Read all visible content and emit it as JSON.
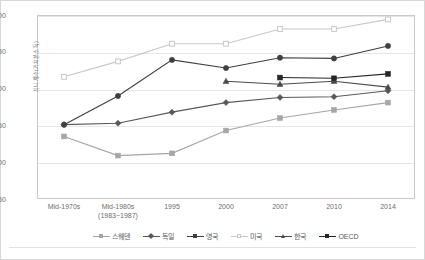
{
  "chart_data": {
    "type": "line",
    "title": "",
    "xlabel": "",
    "ylabel": "지니계수(가처분소득)",
    "ylim": [
      0.15,
      0.4
    ],
    "yticks": [
      "0.150",
      "0.200",
      "0.250",
      "0.300",
      "0.350",
      "0.400"
    ],
    "ytick_values": [
      0.15,
      0.2,
      0.25,
      0.3,
      0.35,
      0.4
    ],
    "grid": true,
    "legend_position": "bottom",
    "categories": [
      "Mid-1970s",
      "Mid-1980s (1983~1987)",
      "1995",
      "2000",
      "2007",
      "2010",
      "2014"
    ],
    "category_labels": [
      {
        "line1": "Mid-1970s",
        "line2": ""
      },
      {
        "line1": "Mid-1980s",
        "line2": "(1983~1987)"
      },
      {
        "line1": "1995",
        "line2": ""
      },
      {
        "line1": "2000",
        "line2": ""
      },
      {
        "line1": "2007",
        "line2": ""
      },
      {
        "line1": "2010",
        "line2": ""
      },
      {
        "line1": "2014",
        "line2": ""
      }
    ],
    "series": [
      {
        "name": "스웨덴",
        "marker": "square",
        "filled": true,
        "color": "#a6a6a6",
        "values": [
          0.235,
          0.209,
          0.212,
          0.243,
          0.26,
          0.271,
          0.281
        ]
      },
      {
        "name": "독일",
        "marker": "diamond",
        "filled": true,
        "color": "#595959",
        "values": [
          0.251,
          0.253,
          0.268,
          0.281,
          0.288,
          0.289,
          0.297
        ]
      },
      {
        "name": "영국",
        "marker": "circle",
        "filled": true,
        "color": "#3f3f3f",
        "values": [
          0.251,
          0.29,
          0.339,
          0.328,
          0.342,
          0.341,
          0.358
        ]
      },
      {
        "name": "미국",
        "marker": "square-open",
        "filled": false,
        "color": "#c8c8c8",
        "values": [
          0.316,
          0.337,
          0.361,
          0.361,
          0.381,
          0.381,
          0.394
        ]
      },
      {
        "name": "한국",
        "marker": "triangle",
        "filled": true,
        "color": "#4a4a4a",
        "values": [
          null,
          null,
          null,
          0.31,
          0.306,
          0.31,
          0.302
        ]
      },
      {
        "name": "OECD",
        "marker": "square",
        "filled": true,
        "color": "#262626",
        "values": [
          null,
          null,
          null,
          null,
          0.315,
          0.314,
          0.32
        ]
      }
    ]
  },
  "legend": {
    "items": [
      {
        "label": "스웨덴",
        "color": "#a6a6a6",
        "marker": "square"
      },
      {
        "label": "독일",
        "color": "#595959",
        "marker": "diamond"
      },
      {
        "label": "영국",
        "color": "#3f3f3f",
        "marker": "circle"
      },
      {
        "label": "미국",
        "color": "#c8c8c8",
        "marker": "square-open"
      },
      {
        "label": "한국",
        "color": "#4a4a4a",
        "marker": "triangle"
      },
      {
        "label": "OECD",
        "color": "#262626",
        "marker": "square"
      }
    ]
  }
}
